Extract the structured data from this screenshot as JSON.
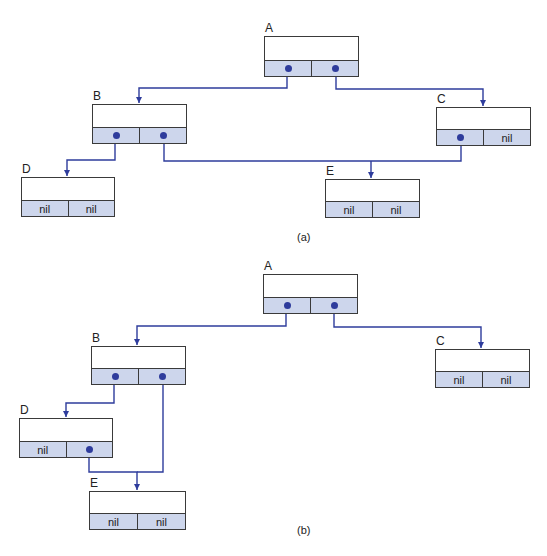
{
  "colors": {
    "pointer": "#2e3c9c",
    "field_fill": "#cdd6ec",
    "border": "#3a3a3a"
  },
  "diagrams": [
    {
      "caption": "(a)",
      "caption_pos": [
        297,
        231
      ],
      "nodes": [
        {
          "id": "A",
          "label": "A",
          "x": 264,
          "y": 36,
          "w": 95,
          "h": 41,
          "left": "•",
          "right": "•"
        },
        {
          "id": "B",
          "label": "B",
          "x": 92,
          "y": 104,
          "w": 95,
          "h": 40,
          "left": "•",
          "right": "•"
        },
        {
          "id": "C",
          "label": "C",
          "x": 436,
          "y": 107,
          "w": 95,
          "h": 39,
          "left": "•",
          "right": "nil"
        },
        {
          "id": "D",
          "label": "D",
          "x": 21,
          "y": 177,
          "w": 94,
          "h": 40,
          "left": "nil",
          "right": "nil"
        },
        {
          "id": "E",
          "label": "E",
          "x": 325,
          "y": 179,
          "w": 95,
          "h": 39,
          "left": "nil",
          "right": "nil"
        }
      ],
      "edges": [
        {
          "from": "A.left",
          "to": "B",
          "path": [
            [
              287,
              68
            ],
            [
              287,
              88
            ],
            [
              139,
              88
            ],
            [
              139,
              103
            ]
          ]
        },
        {
          "from": "A.right",
          "to": "C",
          "path": [
            [
              336,
              68
            ],
            [
              336,
              89
            ],
            [
              483,
              89
            ],
            [
              483,
              106
            ]
          ]
        },
        {
          "from": "B.left",
          "to": "D",
          "path": [
            [
              115,
              136
            ],
            [
              115,
              160
            ],
            [
              67,
              160
            ],
            [
              67,
              176
            ]
          ]
        },
        {
          "from": "B.right",
          "to": "E",
          "path": [
            [
              164,
              136
            ],
            [
              164,
              161
            ],
            [
              461,
              161
            ],
            [
              461,
              137
            ]
          ]
        },
        {
          "from": "C.left",
          "to": "E",
          "path": [
            [
              371,
              161
            ],
            [
              371,
              178
            ]
          ]
        }
      ]
    },
    {
      "caption": "(b)",
      "caption_pos": [
        297,
        524
      ],
      "nodes": [
        {
          "id": "A",
          "label": "A",
          "x": 263,
          "y": 274,
          "w": 95,
          "h": 40,
          "left": "•",
          "right": "•"
        },
        {
          "id": "B",
          "label": "B",
          "x": 91,
          "y": 346,
          "w": 95,
          "h": 39,
          "left": "•",
          "right": "•"
        },
        {
          "id": "C",
          "label": "C",
          "x": 435,
          "y": 349,
          "w": 95,
          "h": 39,
          "left": "nil",
          "right": "nil"
        },
        {
          "id": "D",
          "label": "D",
          "x": 19,
          "y": 418,
          "w": 94,
          "h": 40,
          "left": "nil",
          "right": "•"
        },
        {
          "id": "E",
          "label": "E",
          "x": 89,
          "y": 491,
          "w": 97,
          "h": 39,
          "left": "nil",
          "right": "nil"
        }
      ],
      "edges": [
        {
          "from": "A.left",
          "to": "B",
          "path": [
            [
              286,
              307
            ],
            [
              286,
              326
            ],
            [
              137,
              326
            ],
            [
              137,
              345
            ]
          ]
        },
        {
          "from": "A.right",
          "to": "C",
          "path": [
            [
              334,
              307
            ],
            [
              334,
              327
            ],
            [
              481,
              327
            ],
            [
              481,
              348
            ]
          ]
        },
        {
          "from": "B.left",
          "to": "D",
          "path": [
            [
              114,
              378
            ],
            [
              114,
              403
            ],
            [
              66,
              403
            ],
            [
              66,
              417
            ]
          ]
        },
        {
          "from": "B.right",
          "to": "E",
          "path": [
            [
              163,
              378
            ],
            [
              163,
              472
            ],
            [
              137,
              472
            ]
          ]
        },
        {
          "from": "D.right",
          "to": "E",
          "path": [
            [
              89,
              450
            ],
            [
              89,
              472
            ],
            [
              137,
              472
            ],
            [
              137,
              490
            ]
          ]
        }
      ]
    }
  ]
}
